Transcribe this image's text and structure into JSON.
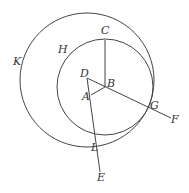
{
  "diagram": {
    "stroke_color": "#444444",
    "circles": [
      {
        "name": "outer-circle-K",
        "cx": 87,
        "cy": 80,
        "r": 67
      },
      {
        "name": "inner-circle-H",
        "cx": 105,
        "cy": 87,
        "r": 48
      }
    ],
    "segments": [
      {
        "name": "segment-BC",
        "x1": 105,
        "y1": 87,
        "x2": 105,
        "y2": 40
      },
      {
        "name": "segment-DF",
        "x1": 87,
        "y1": 78,
        "x2": 171,
        "y2": 118
      },
      {
        "name": "segment-DE",
        "x1": 87,
        "y1": 78,
        "x2": 100,
        "y2": 172
      },
      {
        "name": "segment-AB",
        "x1": 91,
        "y1": 95,
        "x2": 105,
        "y2": 87
      }
    ],
    "labels": [
      {
        "name": "label-C",
        "text": "C",
        "x": 101,
        "y": 25
      },
      {
        "name": "label-H",
        "text": "H",
        "x": 58,
        "y": 44
      },
      {
        "name": "label-K",
        "text": "K",
        "x": 13,
        "y": 56
      },
      {
        "name": "label-D",
        "text": "D",
        "x": 80,
        "y": 68
      },
      {
        "name": "label-B",
        "text": "B",
        "x": 107,
        "y": 78
      },
      {
        "name": "label-A",
        "text": "A",
        "x": 82,
        "y": 91
      },
      {
        "name": "label-G",
        "text": "G",
        "x": 150,
        "y": 100
      },
      {
        "name": "label-F",
        "text": "F",
        "x": 171,
        "y": 114
      },
      {
        "name": "label-L",
        "text": "L",
        "x": 91,
        "y": 142
      },
      {
        "name": "label-E",
        "text": "E",
        "x": 97,
        "y": 172
      }
    ]
  }
}
